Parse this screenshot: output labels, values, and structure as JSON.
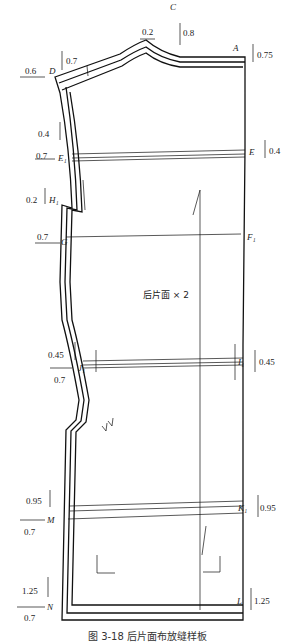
{
  "diagram": {
    "center_label": "后片面 × 2",
    "caption": "图 3-18  后片面布放缝样板",
    "points": [
      {
        "id": "A",
        "label": "A"
      },
      {
        "id": "C",
        "label": "C"
      },
      {
        "id": "D",
        "label": "D"
      },
      {
        "id": "E",
        "label": "E"
      },
      {
        "id": "E1",
        "label": "E₁"
      },
      {
        "id": "F1",
        "label": "F₁"
      },
      {
        "id": "G",
        "label": "G"
      },
      {
        "id": "H1",
        "label": "H₁"
      },
      {
        "id": "I1",
        "label": "I₁"
      },
      {
        "id": "J1",
        "label": "J₁"
      },
      {
        "id": "K1",
        "label": "K₁"
      },
      {
        "id": "L",
        "label": "L"
      },
      {
        "id": "M",
        "label": "M"
      },
      {
        "id": "N",
        "label": "N"
      }
    ],
    "dimensions": {
      "C_h": "0.2",
      "C_v": "0.8",
      "A_v": "0.75",
      "D_h": "0.6",
      "D_v": "0.7",
      "E1_v": "0.4",
      "E1_h": "0.7",
      "E_v": "0.4",
      "H1_v": "0.2",
      "G_h": "0.7",
      "J1_v": "0.45",
      "J1_h": "0.7",
      "I1_v": "0.45",
      "M_v": "0.95",
      "M_h": "0.7",
      "K1_v": "0.95",
      "N_v": "1.25",
      "N_h": "0.7",
      "L_v": "1.25"
    }
  }
}
